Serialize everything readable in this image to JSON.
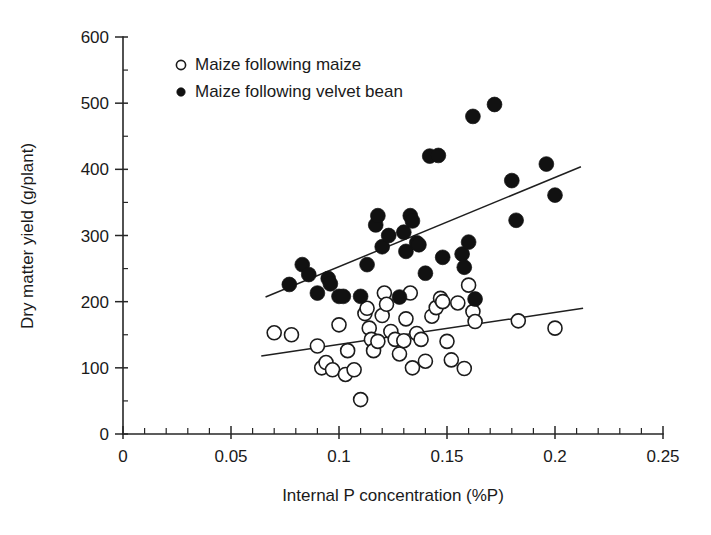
{
  "chart_data": {
    "type": "scatter",
    "title": "",
    "xlabel": "Internal P concentration (%P)",
    "ylabel": "Dry matter yield (g/plant)",
    "xlim": [
      0,
      0.25
    ],
    "ylim": [
      0,
      600
    ],
    "x_ticks": [
      0,
      0.05,
      0.1,
      0.15,
      0.2,
      0.25
    ],
    "x_tick_labels": [
      "0",
      "0.05",
      "0.1",
      "0.15",
      "0.2",
      "0.25"
    ],
    "x_minor_tick_step": 0.01,
    "y_ticks": [
      0,
      100,
      200,
      300,
      400,
      500,
      600
    ],
    "y_tick_labels": [
      "0",
      "100",
      "200",
      "300",
      "400",
      "500",
      "600"
    ],
    "y_minor_tick_step": 50,
    "grid": false,
    "legend_position": "top-left",
    "series": [
      {
        "name": "Maize following maize",
        "marker": "open-circle",
        "marker_color": "#ffffff",
        "marker_edge_color": "#1b1b1b",
        "points": [
          [
            0.07,
            153
          ],
          [
            0.078,
            150
          ],
          [
            0.09,
            133
          ],
          [
            0.092,
            100
          ],
          [
            0.094,
            108
          ],
          [
            0.097,
            97
          ],
          [
            0.1,
            165
          ],
          [
            0.103,
            90
          ],
          [
            0.104,
            126
          ],
          [
            0.107,
            97
          ],
          [
            0.11,
            52
          ],
          [
            0.112,
            182
          ],
          [
            0.113,
            190
          ],
          [
            0.114,
            160
          ],
          [
            0.115,
            143
          ],
          [
            0.116,
            126
          ],
          [
            0.118,
            140
          ],
          [
            0.12,
            179
          ],
          [
            0.121,
            213
          ],
          [
            0.122,
            196
          ],
          [
            0.124,
            155
          ],
          [
            0.126,
            143
          ],
          [
            0.128,
            121
          ],
          [
            0.13,
            141
          ],
          [
            0.131,
            174
          ],
          [
            0.133,
            213
          ],
          [
            0.134,
            100
          ],
          [
            0.136,
            152
          ],
          [
            0.138,
            143
          ],
          [
            0.14,
            110
          ],
          [
            0.143,
            178
          ],
          [
            0.145,
            191
          ],
          [
            0.147,
            205
          ],
          [
            0.148,
            200
          ],
          [
            0.15,
            140
          ],
          [
            0.152,
            112
          ],
          [
            0.155,
            198
          ],
          [
            0.158,
            99
          ],
          [
            0.16,
            225
          ],
          [
            0.162,
            185
          ],
          [
            0.163,
            170
          ],
          [
            0.183,
            171
          ],
          [
            0.2,
            160
          ]
        ],
        "trend_line": {
          "x_start": 0.064,
          "y_start": 118,
          "x_end": 0.213,
          "y_end": 190
        }
      },
      {
        "name": "Maize following velvet bean",
        "marker": "filled-circle",
        "marker_color": "#111111",
        "marker_edge_color": "#111111",
        "points": [
          [
            0.077,
            226
          ],
          [
            0.083,
            256
          ],
          [
            0.086,
            241
          ],
          [
            0.09,
            213
          ],
          [
            0.095,
            235
          ],
          [
            0.096,
            227
          ],
          [
            0.1,
            208
          ],
          [
            0.102,
            208
          ],
          [
            0.11,
            208
          ],
          [
            0.113,
            256
          ],
          [
            0.117,
            316
          ],
          [
            0.118,
            330
          ],
          [
            0.12,
            283
          ],
          [
            0.123,
            300
          ],
          [
            0.128,
            207
          ],
          [
            0.13,
            305
          ],
          [
            0.131,
            276
          ],
          [
            0.133,
            330
          ],
          [
            0.134,
            322
          ],
          [
            0.136,
            289
          ],
          [
            0.137,
            286
          ],
          [
            0.14,
            243
          ],
          [
            0.142,
            420
          ],
          [
            0.146,
            421
          ],
          [
            0.148,
            267
          ],
          [
            0.157,
            272
          ],
          [
            0.158,
            252
          ],
          [
            0.16,
            290
          ],
          [
            0.162,
            480
          ],
          [
            0.163,
            204
          ],
          [
            0.172,
            498
          ],
          [
            0.18,
            383
          ],
          [
            0.182,
            323
          ],
          [
            0.196,
            408
          ],
          [
            0.2,
            361
          ]
        ],
        "trend_line": {
          "x_start": 0.066,
          "y_start": 207,
          "x_end": 0.212,
          "y_end": 404
        }
      }
    ]
  },
  "legend": {
    "items": [
      {
        "label": "Maize following maize",
        "marker": "open-circle"
      },
      {
        "label": "Maize following velvet bean",
        "marker": "filled-circle"
      }
    ]
  },
  "axes": {
    "x_title": "Internal P concentration (%P)",
    "y_title": "Dry matter yield (g/plant)"
  }
}
